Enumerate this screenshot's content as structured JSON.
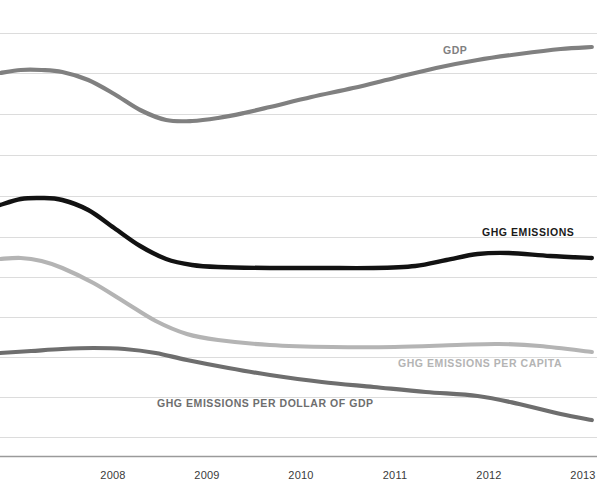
{
  "chart_data": {
    "type": "line",
    "title": "",
    "subtitle": "",
    "xlabel": "",
    "ylabel": "",
    "grid": true,
    "legend_position": "inline-annotations",
    "x_axis": {
      "tick_labels": [
        "2008",
        "2009",
        "2010",
        "2011",
        "2012",
        "2013"
      ],
      "tick_positions_px": [
        113,
        207,
        301,
        395,
        489,
        583
      ],
      "range": [
        2007.4,
        2013.15
      ]
    },
    "y_axis": {
      "visible_ticks": false,
      "gridline_positions_px": [
        33,
        73,
        114,
        155,
        196,
        237,
        277,
        317,
        357,
        397,
        437
      ],
      "baseline_px": 456,
      "note": "indexed series, no numeric tick labels shown"
    },
    "series": [
      {
        "name": "GDP",
        "label": "GDP",
        "color": "#808080",
        "stroke_width": 4.2,
        "label_x_px": 443,
        "label_y_px": 44,
        "x": [
          2007.4,
          2007.6,
          2007.8,
          2008.0,
          2008.25,
          2008.5,
          2008.75,
          2009.0,
          2009.25,
          2009.5,
          2009.75,
          2010.0,
          2010.4,
          2010.8,
          2011.2,
          2011.6,
          2012.0,
          2012.4,
          2012.8,
          2013.1
        ],
        "values_px_y": [
          73,
          70,
          70,
          72,
          80,
          94,
          110,
          120,
          121,
          118,
          113,
          107,
          97,
          88,
          78,
          68,
          60,
          54,
          49,
          47
        ],
        "values_indexed": [
          100.0,
          100.6,
          100.6,
          100.2,
          98.5,
          95.6,
          92.2,
          90.1,
          89.9,
          90.5,
          91.5,
          92.8,
          94.9,
          96.7,
          98.8,
          100.9,
          102.5,
          103.8,
          104.8,
          105.2
        ]
      },
      {
        "name": "GHG EMISSIONS",
        "label": "GHG EMISSIONS",
        "color": "#121212",
        "stroke_width": 4.4,
        "label_x_px": 482,
        "label_y_px": 226,
        "x": [
          2007.4,
          2007.6,
          2007.8,
          2008.0,
          2008.25,
          2008.5,
          2008.75,
          2009.0,
          2009.25,
          2009.5,
          2010.0,
          2010.5,
          2011.0,
          2011.4,
          2011.7,
          2012.0,
          2012.3,
          2012.7,
          2013.1
        ],
        "values_px_y": [
          205,
          199,
          198,
          200,
          210,
          228,
          246,
          259,
          265,
          267,
          268,
          268,
          268,
          266,
          260,
          254,
          253,
          256,
          258
        ],
        "values_indexed": [
          100.0,
          101.2,
          101.4,
          101.0,
          99.0,
          95.4,
          91.8,
          89.2,
          88.0,
          87.6,
          87.4,
          87.4,
          87.4,
          87.8,
          89.0,
          90.2,
          90.4,
          89.8,
          89.4
        ]
      },
      {
        "name": "GHG EMISSIONS PER CAPITA",
        "label": "GHG EMISSIONS PER CAPITA",
        "color": "#b4b4b4",
        "stroke_width": 4.2,
        "label_x_px": 398,
        "label_y_px": 357,
        "x": [
          2007.4,
          2007.6,
          2007.8,
          2008.0,
          2008.3,
          2008.6,
          2008.9,
          2009.2,
          2009.5,
          2010.0,
          2010.6,
          2011.2,
          2011.8,
          2012.2,
          2012.6,
          2013.1
        ],
        "values_px_y": [
          259,
          258,
          261,
          268,
          283,
          302,
          321,
          334,
          340,
          345,
          347,
          347,
          345,
          344,
          346,
          352
        ],
        "values_indexed": [
          100.0,
          100.3,
          99.5,
          97.6,
          93.4,
          88.3,
          83.1,
          79.6,
          78.0,
          76.6,
          76.1,
          76.1,
          76.6,
          76.9,
          76.4,
          74.7
        ]
      },
      {
        "name": "GHG EMISSIONS PER DOLLAR OF GDP",
        "label": "GHG EMISSIONS PER DOLLAR OF GDP",
        "color": "#6e6e6e",
        "stroke_width": 4.2,
        "label_x_px": 157,
        "label_y_px": 397,
        "x": [
          2007.4,
          2007.7,
          2008.0,
          2008.3,
          2008.6,
          2008.9,
          2009.2,
          2009.6,
          2010.0,
          2010.5,
          2011.0,
          2011.5,
          2012.0,
          2012.4,
          2012.8,
          2013.1
        ],
        "values_px_y": [
          353,
          351,
          349,
          348,
          349,
          353,
          360,
          368,
          375,
          382,
          387,
          392,
          396,
          404,
          414,
          420
        ],
        "values_indexed": [
          100.0,
          100.6,
          101.2,
          101.5,
          101.2,
          100.0,
          97.9,
          95.6,
          93.6,
          91.5,
          90.0,
          88.6,
          87.4,
          85.1,
          82.2,
          80.5
        ]
      }
    ]
  },
  "style": {
    "background": "#ffffff",
    "gridline_color": "#dcdcdc",
    "baseline_color": "#9a9a9a",
    "tick_label_color": "#3a3a3a"
  }
}
